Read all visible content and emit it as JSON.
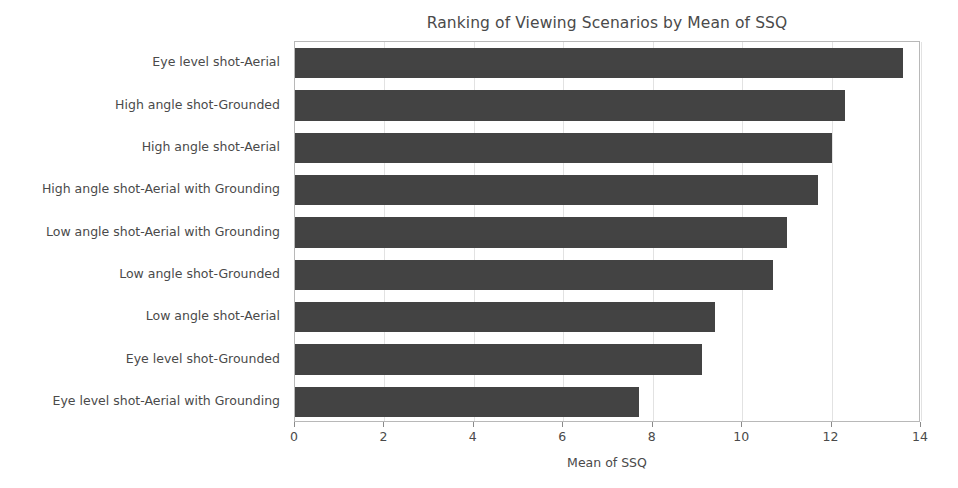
{
  "chart_data": {
    "type": "bar",
    "orientation": "horizontal",
    "title": "Ranking of Viewing Scenarios by Mean of SSQ",
    "xlabel": "Mean of SSQ",
    "ylabel": "",
    "xlim": [
      0,
      14
    ],
    "xticks": [
      0,
      2,
      4,
      6,
      8,
      10,
      12,
      14
    ],
    "xtick_labels": [
      "0",
      "2",
      "4",
      "6",
      "8",
      "10",
      "12",
      "14"
    ],
    "grid": true,
    "grid_axis": "x",
    "legend": false,
    "bar_color": "#434343",
    "categories": [
      "Eye level shot-Aerial",
      "High angle shot-Grounded",
      "High angle shot-Aerial",
      "High angle shot-Aerial with Grounding",
      "Low angle shot-Aerial with Grounding",
      "Low angle shot-Grounded",
      "Low angle shot-Aerial",
      "Eye level shot-Grounded",
      "Eye level shot-Aerial with Grounding"
    ],
    "values": [
      13.6,
      12.3,
      12.0,
      11.7,
      11.0,
      10.7,
      9.4,
      9.1,
      7.7
    ]
  }
}
